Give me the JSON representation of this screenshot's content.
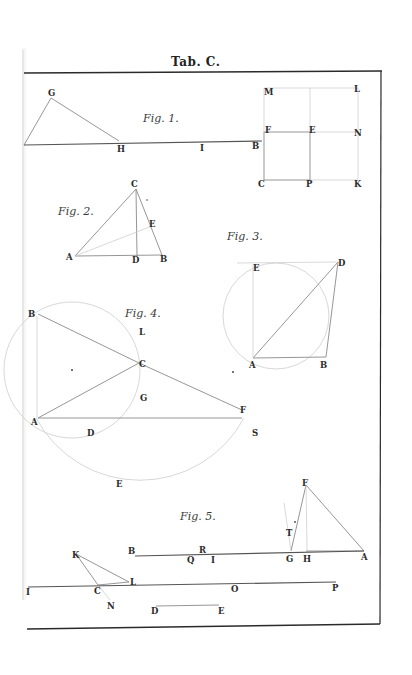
{
  "plate": {
    "title": "Tab. C.",
    "figures": [
      {
        "id": "fig1",
        "caption": "Fig. 1.",
        "labels": [
          "G",
          "H",
          "I",
          "B",
          "M",
          "L",
          "F",
          "E",
          "N",
          "C",
          "P",
          "K"
        ]
      },
      {
        "id": "fig2",
        "caption": "Fig. 2.",
        "labels": [
          "C",
          "E",
          "A",
          "D",
          "B"
        ]
      },
      {
        "id": "fig3",
        "caption": "Fig. 3.",
        "labels": [
          "E",
          "D",
          "A",
          "B"
        ]
      },
      {
        "id": "fig4",
        "caption": "Fig. 4.",
        "labels": [
          "B",
          "L",
          "C",
          "G",
          "A",
          "D",
          "F",
          "S",
          "E"
        ]
      },
      {
        "id": "fig5",
        "caption": "Fig. 5.",
        "labels": [
          "F",
          "T",
          "B",
          "R",
          "Q",
          "I",
          "G",
          "H",
          "A",
          "K",
          "L",
          "C",
          "N",
          "O",
          "P",
          "D",
          "E",
          "I"
        ]
      }
    ]
  }
}
